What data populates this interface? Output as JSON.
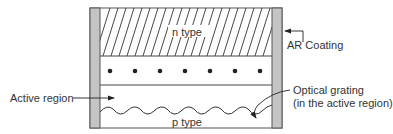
{
  "diagram": {
    "layers": {
      "n_type": "n type",
      "p_type": "p type"
    },
    "annotations": {
      "ar_coating": "AR Coating",
      "active_region": "Active region",
      "optical_grating_line1": "Optical grating",
      "optical_grating_line2": "(in the active region)"
    },
    "colors": {
      "coating": "#c4c4c4",
      "line": "#3a3a3a",
      "background": "#ffffff"
    },
    "dot_count": 7
  }
}
